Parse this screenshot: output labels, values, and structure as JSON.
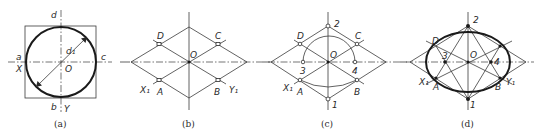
{
  "figure": {
    "colors": {
      "line": "#3a3a3a",
      "bold": "#1a1a1a",
      "background": "#ffffff"
    },
    "panels": [
      {
        "id": "a",
        "caption": "(a)",
        "labels": {
          "d": "d",
          "a": "a",
          "c": "c",
          "b": "b",
          "X": "X",
          "Y": "Y",
          "O": "O",
          "d1": "d₁"
        }
      },
      {
        "id": "b",
        "caption": "(b)",
        "labels": {
          "D": "D",
          "C": "C",
          "O": "O",
          "A": "A",
          "B": "B",
          "X1": "X₁",
          "Y1": "Y₁"
        }
      },
      {
        "id": "c",
        "caption": "(c)",
        "labels": {
          "two": "2",
          "one": "1",
          "D": "D",
          "C": "C",
          "O": "O",
          "three": "3",
          "four": "4",
          "A": "A",
          "B": "B",
          "X1": "X₁"
        }
      },
      {
        "id": "d",
        "caption": "(d)",
        "labels": {
          "two": "2",
          "one": "1",
          "D": "D",
          "O": "O",
          "three": "3",
          "four": "4",
          "A": "A",
          "B": "B",
          "X1": "X₁",
          "Y1": "Y₁"
        }
      }
    ]
  }
}
